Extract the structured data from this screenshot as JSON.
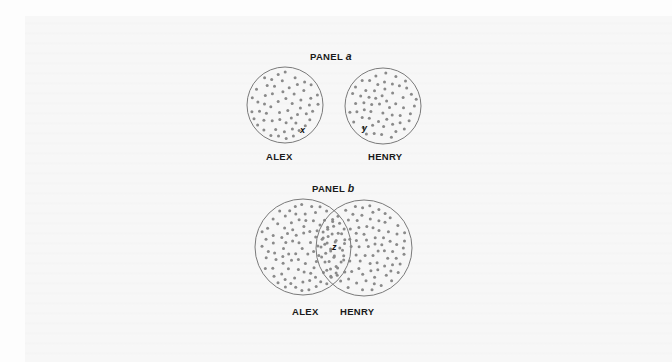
{
  "figure": {
    "background": "#fdfdfd",
    "ring_color": "#7a7a7a",
    "dot_color": "#8a8a8a",
    "text_color": "#1a1a1a"
  },
  "panels": [
    {
      "id": "a",
      "title_prefix": "PANEL ",
      "title_letter": "a",
      "title_pos": [
        310,
        60
      ],
      "overlapping": false,
      "circles": [
        {
          "name": "ALEX",
          "cx": 285,
          "cy": 105,
          "r": 38,
          "dots": 58,
          "label": "ALEX",
          "label_pos": [
            266,
            160
          ],
          "seed": 11
        },
        {
          "name": "HENRY",
          "cx": 383,
          "cy": 106,
          "r": 38,
          "dots": 58,
          "label": "HENRY",
          "label_pos": [
            368,
            160
          ],
          "seed": 23
        }
      ],
      "markers": [
        {
          "text": "x",
          "x": 300,
          "y": 133
        },
        {
          "text": "y",
          "x": 362,
          "y": 131
        }
      ]
    },
    {
      "id": "b",
      "title_prefix": "PANEL ",
      "title_letter": "b",
      "title_pos": [
        312,
        192
      ],
      "overlapping": true,
      "circles": [
        {
          "name": "ALEX",
          "cx": 303,
          "cy": 247,
          "r": 48,
          "dots": 100,
          "label": "ALEX",
          "label_pos": [
            292,
            315
          ],
          "seed": 37
        },
        {
          "name": "HENRY",
          "cx": 364,
          "cy": 248,
          "r": 48,
          "dots": 100,
          "label": "HENRY",
          "label_pos": [
            340,
            315
          ],
          "seed": 51
        }
      ],
      "markers": [
        {
          "text": "z",
          "x": 332,
          "y": 250
        }
      ]
    }
  ]
}
